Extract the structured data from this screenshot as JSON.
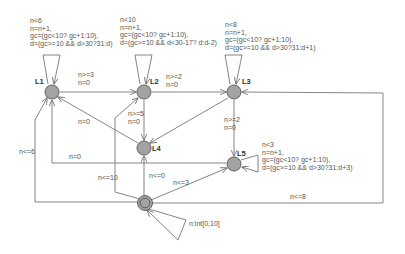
{
  "diagram": {
    "type": "automaton",
    "colors": {
      "node_fill": "#a0a0a0",
      "node_stroke": "#555555",
      "edge": "#666666",
      "text": "#555555"
    },
    "locations": [
      {
        "id": "L1",
        "label": "L1",
        "x": 52,
        "y": 92
      },
      {
        "id": "L2",
        "label": "L2",
        "x": 144,
        "y": 92
      },
      {
        "id": "L3",
        "label": "L3",
        "x": 234,
        "y": 92
      },
      {
        "id": "L4",
        "label": "L4",
        "x": 144,
        "y": 148
      },
      {
        "id": "L5",
        "label": "L5",
        "x": 234,
        "y": 164
      },
      {
        "id": "init",
        "label": "",
        "x": 145,
        "y": 203,
        "initial": true
      }
    ],
    "self_loops": {
      "L1": [
        "n<6",
        "n=n+1,",
        "gc=(gc<10? gc+1:10),",
        "d=(gc>=10 && d>30?31:d)"
      ],
      "L2": [
        "n<10",
        "n=n+1,",
        "gc=(gc<10? gc+1:10),",
        "d=(gc>=10 && d<30-17? d:d-2)"
      ],
      "L3": [
        "n<8",
        "n=n+1,",
        "gc=(gc<10? gc+1:10),",
        "d=(gc>=10 && d>30?31:d+1)"
      ],
      "L5": [
        "n<3",
        "n=n+1,",
        "gc=(gc<10? gc+1:10),",
        "d=(gc>=10 && d>30?31:d+3)"
      ],
      "init": [
        "n:int[0,10]"
      ]
    },
    "edges": {
      "L1_L2": [
        "n>=3",
        "n=0"
      ],
      "L2_L3": [
        "n>=2",
        "n=0"
      ],
      "L2_L4": [
        "n>=5",
        "n=0"
      ],
      "L4_L1": [
        "n=0"
      ],
      "L3_L5": [
        "n>=2",
        "n=0"
      ],
      "L5_L1": [
        "n=0"
      ],
      "init_L1": [
        "n<=6"
      ],
      "init_L2": [
        "n<=10"
      ],
      "init_L4": [
        "n<=0"
      ],
      "init_L5": [
        "n<=3"
      ],
      "init_L3": [
        "n<=8"
      ]
    }
  }
}
